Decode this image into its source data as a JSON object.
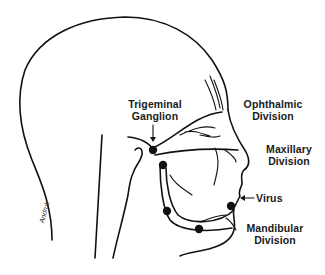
{
  "diagram": {
    "labels": {
      "trigeminal_ganglion_line1": "Trigeminal",
      "trigeminal_ganglion_line2": "Ganglion",
      "ophthalmic_line1": "Ophthalmic",
      "ophthalmic_line2": "Division",
      "maxillary_line1": "Maxillary",
      "maxillary_line2": "Division",
      "virus": "Virus",
      "mandibular_line1": "Mandibular",
      "mandibular_line2": "Division"
    },
    "signature": "Andruk",
    "colors": {
      "ink": "#111111",
      "background": "#ffffff"
    }
  }
}
